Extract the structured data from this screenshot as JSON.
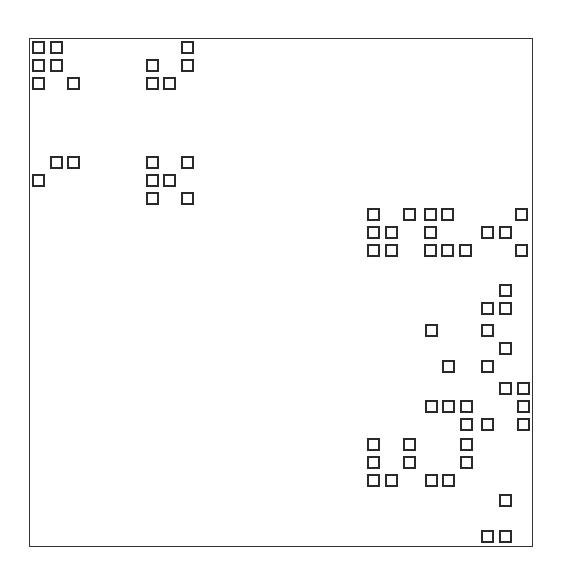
{
  "diagram": {
    "type": "sparsity-pattern",
    "frame": {
      "left": 29,
      "top": 38,
      "right": 533,
      "bottom": 547,
      "border_color": "#333333"
    },
    "cell": {
      "size": 13,
      "border_color": "#2a2a2a",
      "fill": "#ffffff"
    },
    "squares": [
      [
        32,
        41
      ],
      [
        50,
        41
      ],
      [
        181,
        41
      ],
      [
        32,
        59
      ],
      [
        50,
        59
      ],
      [
        146,
        59
      ],
      [
        181,
        59
      ],
      [
        32,
        77
      ],
      [
        67,
        77
      ],
      [
        146,
        77
      ],
      [
        163,
        77
      ],
      [
        50,
        156
      ],
      [
        67,
        156
      ],
      [
        146,
        156
      ],
      [
        181,
        156
      ],
      [
        32,
        174
      ],
      [
        146,
        174
      ],
      [
        163,
        174
      ],
      [
        146,
        192
      ],
      [
        181,
        192
      ],
      [
        367,
        208
      ],
      [
        403,
        208
      ],
      [
        424,
        208
      ],
      [
        441,
        208
      ],
      [
        515,
        208
      ],
      [
        367,
        226
      ],
      [
        385,
        226
      ],
      [
        424,
        226
      ],
      [
        481,
        226
      ],
      [
        499,
        226
      ],
      [
        367,
        244
      ],
      [
        385,
        244
      ],
      [
        424,
        244
      ],
      [
        441,
        244
      ],
      [
        459,
        244
      ],
      [
        515,
        244
      ],
      [
        499,
        284
      ],
      [
        481,
        302
      ],
      [
        499,
        302
      ],
      [
        425,
        324
      ],
      [
        481,
        324
      ],
      [
        499,
        342
      ],
      [
        442,
        360
      ],
      [
        481,
        360
      ],
      [
        499,
        382
      ],
      [
        517,
        382
      ],
      [
        425,
        400
      ],
      [
        442,
        400
      ],
      [
        460,
        400
      ],
      [
        517,
        400
      ],
      [
        460,
        418
      ],
      [
        481,
        418
      ],
      [
        517,
        418
      ],
      [
        367,
        438
      ],
      [
        403,
        438
      ],
      [
        460,
        438
      ],
      [
        367,
        456
      ],
      [
        403,
        456
      ],
      [
        460,
        456
      ],
      [
        367,
        474
      ],
      [
        385,
        474
      ],
      [
        425,
        474
      ],
      [
        442,
        474
      ],
      [
        499,
        494
      ],
      [
        481,
        530
      ],
      [
        499,
        530
      ]
    ]
  }
}
